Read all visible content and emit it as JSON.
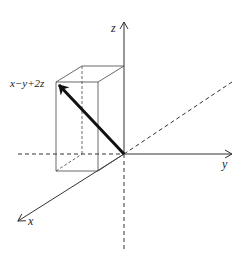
{
  "diagram": {
    "type": "3d-vector-diagram",
    "axes": {
      "z": {
        "label": "z"
      },
      "y": {
        "label": "y"
      },
      "x": {
        "label": "x"
      }
    },
    "vector": {
      "label": "x−y+2z",
      "components": {
        "x": 1,
        "y": -1,
        "z": 2
      }
    },
    "colors": {
      "line": "#333333",
      "vector": "#111111",
      "background": "#ffffff"
    }
  }
}
